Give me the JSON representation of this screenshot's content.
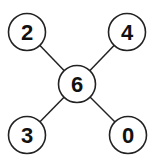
{
  "diagram": {
    "type": "star-graph",
    "nodes": [
      {
        "id": "center",
        "label": "6",
        "cx": 77,
        "cy": 84
      },
      {
        "id": "top-left",
        "label": "2",
        "cx": 27,
        "cy": 32
      },
      {
        "id": "top-right",
        "label": "4",
        "cx": 127,
        "cy": 32
      },
      {
        "id": "bottom-left",
        "label": "3",
        "cx": 27,
        "cy": 135
      },
      {
        "id": "bottom-right",
        "label": "0",
        "cx": 128,
        "cy": 135
      }
    ],
    "edges": [
      {
        "from": "center",
        "to": "top-left"
      },
      {
        "from": "center",
        "to": "top-right"
      },
      {
        "from": "center",
        "to": "bottom-left"
      },
      {
        "from": "center",
        "to": "bottom-right"
      }
    ],
    "colors": {
      "stroke": "#222222",
      "fill": "#ffffff",
      "text": "#111111"
    }
  }
}
